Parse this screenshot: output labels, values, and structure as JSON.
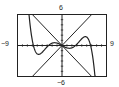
{
  "chart_data": {
    "type": "line",
    "title": "",
    "xlabel": "",
    "ylabel": "",
    "xlim": [
      -9,
      9
    ],
    "ylim": [
      -6,
      6
    ],
    "tick_labels": {
      "top": "6",
      "bottom": "−6",
      "left": "−9",
      "right": "9"
    },
    "grid": false,
    "axes_ticks": "unit ticks along both axes",
    "series": [
      {
        "name": "polynomial curve",
        "points": [
          [
            -8.2,
            6
          ],
          [
            -6.8,
            -5.2
          ],
          [
            -6,
            -5.8
          ],
          [
            -4.5,
            -1
          ],
          [
            -3,
            2.6
          ],
          [
            -2,
            2
          ],
          [
            -1,
            0.3
          ],
          [
            0,
            0
          ],
          [
            1,
            -0.3
          ],
          [
            2,
            -2
          ],
          [
            3,
            -2.6
          ],
          [
            4.5,
            1
          ],
          [
            6,
            5.8
          ],
          [
            6.8,
            5.2
          ],
          [
            8.2,
            -6
          ]
        ]
      },
      {
        "name": "line y=x",
        "points": [
          [
            -6,
            -6
          ],
          [
            6,
            6
          ]
        ]
      },
      {
        "name": "line y=-x",
        "points": [
          [
            -6,
            6
          ],
          [
            6,
            -6
          ]
        ]
      }
    ]
  },
  "labels": {
    "top": "6",
    "bottom": "−6",
    "left": "−9",
    "right": "9"
  }
}
